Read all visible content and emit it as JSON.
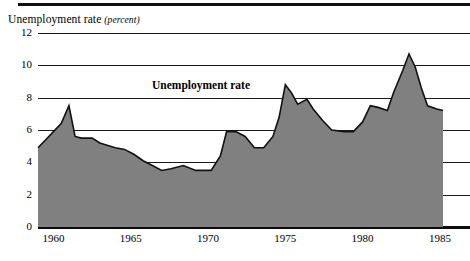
{
  "chart_data": {
    "type": "area",
    "title": "Unemployment rate (percent)",
    "title_main": "Unemployment rate",
    "title_unit": "(percent)",
    "series_label": "Unemployment rate",
    "xlabel": "",
    "ylabel": "percent",
    "ylim": [
      0,
      12
    ],
    "xlim": [
      1959,
      1985.2
    ],
    "grid": true,
    "legend_position": "inside-top-center",
    "yticks": [
      0,
      2,
      4,
      6,
      8,
      10,
      12
    ],
    "ytick_labels": [
      "0",
      "2",
      "4",
      "6",
      "8",
      "10",
      "12"
    ],
    "xticks": [
      1960,
      1965,
      1970,
      1975,
      1980,
      1985
    ],
    "xtick_labels": [
      "1960",
      "1965",
      "1970",
      "1975",
      "1980",
      "1985"
    ],
    "x": [
      1959.0,
      1959.5,
      1960.0,
      1960.5,
      1961.0,
      1961.4,
      1961.8,
      1962.5,
      1963.0,
      1964.0,
      1964.6,
      1965.2,
      1965.8,
      1966.4,
      1967.0,
      1967.6,
      1968.4,
      1969.2,
      1969.8,
      1970.2,
      1970.8,
      1971.2,
      1971.8,
      1972.4,
      1973.0,
      1973.6,
      1974.2,
      1974.6,
      1975.0,
      1975.4,
      1975.8,
      1976.4,
      1976.8,
      1977.4,
      1978.0,
      1978.8,
      1979.4,
      1980.0,
      1980.5,
      1981.0,
      1981.6,
      1982.0,
      1982.6,
      1983.0,
      1983.4,
      1983.8,
      1984.2,
      1984.8,
      1985.2
    ],
    "values": [
      4.9,
      5.4,
      5.9,
      6.4,
      7.5,
      5.6,
      5.5,
      5.5,
      5.2,
      4.9,
      4.8,
      4.5,
      4.1,
      3.8,
      3.5,
      3.6,
      3.8,
      3.5,
      3.5,
      3.5,
      4.4,
      5.9,
      5.9,
      5.6,
      4.9,
      4.9,
      5.6,
      6.8,
      8.8,
      8.3,
      7.6,
      7.9,
      7.3,
      6.6,
      6.0,
      5.9,
      5.9,
      6.5,
      7.5,
      7.4,
      7.2,
      8.3,
      9.7,
      10.7,
      9.9,
      8.6,
      7.5,
      7.3,
      7.2
    ],
    "annotations": [
      {
        "text": "Unemployment rate",
        "x": 1966.5,
        "y": 8.6,
        "style": "bold"
      }
    ],
    "colors": {
      "fill": "#808080",
      "line": "#111111",
      "grid": "#1b1b1b",
      "axis": "#0d0d0d",
      "background": "#ffffff"
    }
  }
}
